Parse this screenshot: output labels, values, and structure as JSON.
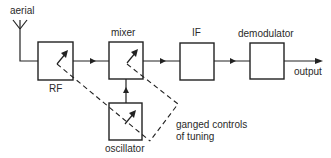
{
  "labels": {
    "aerial": "aerial",
    "rf": "RF",
    "mixer": "mixer",
    "if": "IF",
    "demodulator": "demodulator",
    "output": "output",
    "oscillator": "oscillator",
    "ganged_line1": "ganged controls",
    "ganged_line2": "of tuning"
  },
  "blocks": [
    {
      "id": "rf",
      "label": "RF",
      "variable": true
    },
    {
      "id": "mixer",
      "label": "mixer",
      "variable": true
    },
    {
      "id": "if",
      "label": "IF",
      "variable": false
    },
    {
      "id": "demodulator",
      "label": "demodulator",
      "variable": false
    },
    {
      "id": "oscillator",
      "label": "oscillator",
      "variable": true
    }
  ],
  "connections": [
    {
      "from": "aerial",
      "to": "rf"
    },
    {
      "from": "rf",
      "to": "mixer"
    },
    {
      "from": "oscillator",
      "to": "mixer"
    },
    {
      "from": "mixer",
      "to": "if"
    },
    {
      "from": "if",
      "to": "demodulator"
    },
    {
      "from": "demodulator",
      "to": "output"
    }
  ],
  "annotation": "ganged controls of tuning (dashed link between RF, mixer and oscillator tuning)"
}
